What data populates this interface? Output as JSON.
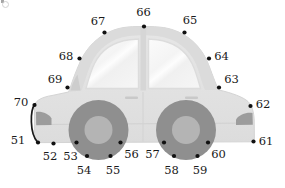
{
  "figure": {
    "view": "side profile, facing left",
    "width": 285,
    "height": 188,
    "background_color": "#ffffff",
    "label_color": "#1a1a1a",
    "point_color": "#111111",
    "point_radius": 2.1
  },
  "palette": {
    "body_fill": "#e2e2e2",
    "body_stroke": "#d2d2d2",
    "roof_fill": "#dadada",
    "window_fill": "#f2f2f2",
    "window_highlight": "#fafafa",
    "window_frame": "#d8d8d8",
    "tire_fill": "#8f8f8f",
    "hub_fill": "#b4b4b4",
    "lamp_fill": "#9d9d9d",
    "trim_line": "#cfcfcf",
    "handle_fill": "#c8c8c8"
  },
  "keypoints": [
    {
      "id": "51",
      "label": "51",
      "x": 38.0,
      "y": 142.5,
      "label_x": 18.0,
      "label_y": 141.0,
      "part": "front-bumper-bottom"
    },
    {
      "id": "52",
      "label": "52",
      "x": 53.5,
      "y": 143.5,
      "label_x": 50.0,
      "label_y": 156.5,
      "part": "front-underbody"
    },
    {
      "id": "53",
      "label": "53",
      "x": 76.5,
      "y": 142.5,
      "label_x": 70.5,
      "label_y": 156.5,
      "part": "front-wheel-left"
    },
    {
      "id": "54",
      "label": "54",
      "x": 87.0,
      "y": 156.0,
      "label_x": 84.0,
      "label_y": 170.5,
      "part": "front-wheel-bottom-left"
    },
    {
      "id": "55",
      "label": "55",
      "x": 110.5,
      "y": 156.0,
      "label_x": 113.0,
      "label_y": 170.5,
      "part": "front-wheel-bottom-right"
    },
    {
      "id": "56",
      "label": "56",
      "x": 120.5,
      "y": 142.5,
      "label_x": 131.5,
      "label_y": 155.0,
      "part": "front-wheel-right"
    },
    {
      "id": "57",
      "label": "57",
      "x": 164.0,
      "y": 142.5,
      "label_x": 152.5,
      "label_y": 155.0,
      "part": "rear-wheel-left"
    },
    {
      "id": "58",
      "label": "58",
      "x": 174.0,
      "y": 156.0,
      "label_x": 171.5,
      "label_y": 170.5,
      "part": "rear-wheel-bottom-left"
    },
    {
      "id": "59",
      "label": "59",
      "x": 197.5,
      "y": 156.0,
      "label_x": 200.0,
      "label_y": 170.5,
      "part": "rear-wheel-bottom-right"
    },
    {
      "id": "60",
      "label": "60",
      "x": 208.0,
      "y": 142.5,
      "label_x": 218.5,
      "label_y": 155.0,
      "part": "rear-wheel-right"
    },
    {
      "id": "61",
      "label": "61",
      "x": 253.5,
      "y": 141.5,
      "label_x": 266.0,
      "label_y": 141.5,
      "part": "rear-bumper-bottom"
    },
    {
      "id": "62",
      "label": "62",
      "x": 250.5,
      "y": 106.0,
      "label_x": 263.0,
      "label_y": 104.5,
      "part": "rear-body-corner"
    },
    {
      "id": "63",
      "label": "63",
      "x": 219.0,
      "y": 87.5,
      "label_x": 231.5,
      "label_y": 80.0,
      "part": "rear-window-base"
    },
    {
      "id": "64",
      "label": "64",
      "x": 209.0,
      "y": 58.5,
      "label_x": 221.5,
      "label_y": 57.0,
      "part": "rear-roof-pillar"
    },
    {
      "id": "65",
      "label": "65",
      "x": 184.5,
      "y": 32.5,
      "label_x": 190.0,
      "label_y": 21.0,
      "part": "roof-rear"
    },
    {
      "id": "66",
      "label": "66",
      "x": 144.0,
      "y": 26.5,
      "label_x": 143.5,
      "label_y": 13.0,
      "part": "roof-center"
    },
    {
      "id": "67",
      "label": "67",
      "x": 104.5,
      "y": 32.5,
      "label_x": 98.0,
      "label_y": 21.5,
      "part": "roof-front"
    },
    {
      "id": "68",
      "label": "68",
      "x": 79.5,
      "y": 58.5,
      "label_x": 66.0,
      "label_y": 57.0,
      "part": "front-roof-pillar"
    },
    {
      "id": "69",
      "label": "69",
      "x": 67.5,
      "y": 87.5,
      "label_x": 55.0,
      "label_y": 80.0,
      "part": "windshield-base"
    },
    {
      "id": "70",
      "label": "70",
      "x": 34.5,
      "y": 105.0,
      "label_x": 21.0,
      "label_y": 102.5,
      "part": "front-hood-corner"
    }
  ],
  "car_parts": [
    {
      "name": "body-shell",
      "description": "main light-gray car silhouette"
    },
    {
      "name": "roof-arch",
      "description": "rounded cabin roof over the greenhouse"
    },
    {
      "name": "front-window",
      "description": "forward door glass, quarter-round"
    },
    {
      "name": "rear-window",
      "description": "rear door glass, quarter-round"
    },
    {
      "name": "b-pillar",
      "description": "vertical divider between the two windows"
    },
    {
      "name": "door-seam",
      "description": "vertical door split line on the body"
    },
    {
      "name": "front-door-handle",
      "description": "small horizontal handle on front door"
    },
    {
      "name": "rear-door-handle",
      "description": "small horizontal handle on rear door"
    },
    {
      "name": "body-side-trim",
      "description": "horizontal crease line along the lower body"
    },
    {
      "name": "headlamp",
      "description": "dark wedge at the front fender"
    },
    {
      "name": "taillamp",
      "description": "dark wedge at the rear fender"
    },
    {
      "name": "front-wheel",
      "description": "front tire and hub"
    },
    {
      "name": "rear-wheel",
      "description": "rear tire and hub"
    },
    {
      "name": "front-bumper-curve",
      "description": "curved connector arc from point 70 to point 51"
    }
  ]
}
